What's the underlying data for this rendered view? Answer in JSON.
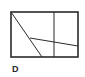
{
  "figure": {
    "label": "D",
    "stroke_color": "#2a2a2a",
    "background": "#ffffff",
    "rectangle": {
      "x": 11,
      "y": 12,
      "width": 67,
      "height": 45
    },
    "lines": [
      {
        "name": "vertical-divider",
        "x1": 54,
        "y1": 12,
        "x2": 54,
        "y2": 57
      },
      {
        "name": "diagonal",
        "x1": 11,
        "y1": 12,
        "x2": 42,
        "y2": 57
      },
      {
        "name": "slanted-crossline",
        "x1": 30,
        "y1": 38,
        "x2": 78,
        "y2": 46
      }
    ]
  }
}
